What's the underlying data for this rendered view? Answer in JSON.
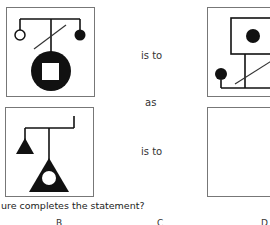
{
  "analogy": {
    "relation_1": "is to",
    "connector": "as",
    "relation_2": "is to"
  },
  "panels": [
    {
      "id": "A",
      "content": "T-branch with hollow circle left, filled circle right, diagonal slash, large black circle with white square"
    },
    {
      "id": "B",
      "content": "Square frame with black dot, vertical stem with diagonal slash, L-base with filled circle left"
    },
    {
      "id": "C",
      "content": "Branch with hook right, small black triangle left, large black triangle with white circle"
    },
    {
      "id": "D",
      "content": "Empty answer box"
    }
  ],
  "question": {
    "text": "ure completes the statement?"
  },
  "options": [
    "B",
    "C",
    "D"
  ],
  "colors": {
    "ink": "#111111",
    "border": "#777777",
    "background": "#ffffff"
  }
}
